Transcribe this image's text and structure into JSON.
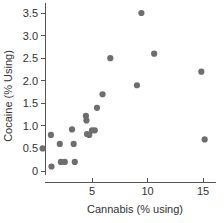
{
  "chart_data": {
    "type": "scatter",
    "title": "",
    "xlabel": "Cannabis (% using)",
    "ylabel": "Cocaine (% Using)",
    "xlim": [
      0,
      16.2
    ],
    "ylim": [
      0,
      3.72
    ],
    "xticks": [
      5,
      10,
      15
    ],
    "xtick_labels": [
      "5",
      "10",
      "15"
    ],
    "yticks": [
      0,
      0.5,
      1.0,
      1.5,
      2.0,
      2.5,
      3.0,
      3.5
    ],
    "ytick_labels": [
      "0",
      "0.5",
      "1.0",
      "1.5",
      "2.0",
      "2.5",
      "3.0",
      "3.5"
    ],
    "grid": false,
    "legend": false,
    "marker_color": "#6e6e6e",
    "marker_size": 3.1,
    "points": [
      {
        "x": 0.55,
        "y": 0.5
      },
      {
        "x": 1.3,
        "y": 0.8
      },
      {
        "x": 1.35,
        "y": 0.1
      },
      {
        "x": 2.1,
        "y": 0.6
      },
      {
        "x": 2.2,
        "y": 0.2
      },
      {
        "x": 2.55,
        "y": 0.2
      },
      {
        "x": 3.2,
        "y": 0.92
      },
      {
        "x": 3.35,
        "y": 0.6
      },
      {
        "x": 3.45,
        "y": 0.2
      },
      {
        "x": 4.45,
        "y": 1.22
      },
      {
        "x": 4.5,
        "y": 1.12
      },
      {
        "x": 4.55,
        "y": 0.82
      },
      {
        "x": 4.75,
        "y": 0.8
      },
      {
        "x": 5.0,
        "y": 0.9
      },
      {
        "x": 5.25,
        "y": 0.9
      },
      {
        "x": 5.45,
        "y": 1.4
      },
      {
        "x": 5.95,
        "y": 1.7
      },
      {
        "x": 6.65,
        "y": 2.5
      },
      {
        "x": 9.05,
        "y": 1.9
      },
      {
        "x": 9.45,
        "y": 3.5
      },
      {
        "x": 10.6,
        "y": 2.6
      },
      {
        "x": 14.85,
        "y": 2.2
      },
      {
        "x": 15.15,
        "y": 0.7
      }
    ]
  }
}
